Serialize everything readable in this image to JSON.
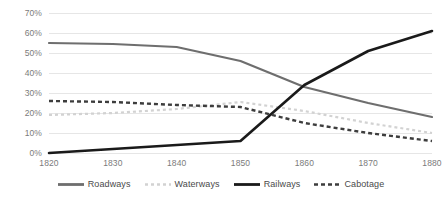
{
  "chart_data": {
    "type": "line",
    "title": "",
    "subtitle": "",
    "xlabel": "",
    "ylabel": "",
    "x": [
      1820,
      1830,
      1840,
      1850,
      1860,
      1870,
      1880
    ],
    "categories": [
      "1820",
      "1830",
      "1840",
      "1850",
      "1860",
      "1870",
      "1880"
    ],
    "xlim": [
      1820,
      1880
    ],
    "ylim": [
      0,
      70
    ],
    "ytick_values": [
      0,
      10,
      20,
      30,
      40,
      50,
      60,
      70
    ],
    "ytick_labels": [
      "0%",
      "10%",
      "20%",
      "30%",
      "40%",
      "50%",
      "60%",
      "70%"
    ],
    "xtick_labels": [
      "1820",
      "1830",
      "1840",
      "1850",
      "1860",
      "1870",
      "1880"
    ],
    "grid": true,
    "grid_axis": "y",
    "grid_color": "#e6e6e6",
    "legend_position": "bottom",
    "series": [
      {
        "name": "Roadways",
        "values": [
          55,
          54.5,
          53,
          46,
          33,
          25,
          18
        ],
        "color": "#6e6e6e",
        "style": "solid",
        "width": 2.2,
        "dasharray": ""
      },
      {
        "name": "Waterways",
        "values": [
          19,
          20,
          22,
          25.5,
          21,
          15,
          10
        ],
        "color": "#d2d2d2",
        "style": "dotted",
        "width": 2.2,
        "dasharray": "3,3"
      },
      {
        "name": "Railways",
        "values": [
          0,
          2,
          4,
          6,
          34,
          51,
          61
        ],
        "color": "#1a1a1a",
        "style": "solid",
        "width": 2.6,
        "dasharray": ""
      },
      {
        "name": "Cabotage",
        "values": [
          26,
          25.5,
          24,
          23,
          15,
          10,
          6
        ],
        "color": "#3d3d3d",
        "style": "dashed",
        "width": 2.4,
        "dasharray": "4,3"
      }
    ]
  },
  "axis": {
    "y_labels": [
      {
        "text": "70%",
        "value": 70
      },
      {
        "text": "60%",
        "value": 60
      },
      {
        "text": "50%",
        "value": 50
      },
      {
        "text": "40%",
        "value": 40
      },
      {
        "text": "30%",
        "value": 30
      },
      {
        "text": "20%",
        "value": 20
      },
      {
        "text": "10%",
        "value": 10
      },
      {
        "text": "0%",
        "value": 0
      }
    ],
    "x_labels": [
      {
        "text": "1820",
        "value": 1820
      },
      {
        "text": "1830",
        "value": 1830
      },
      {
        "text": "1840",
        "value": 1840
      },
      {
        "text": "1850",
        "value": 1850
      },
      {
        "text": "1860",
        "value": 1860
      },
      {
        "text": "1870",
        "value": 1870
      },
      {
        "text": "1880",
        "value": 1880
      }
    ]
  },
  "legend": {
    "items": [
      {
        "label": "Roadways",
        "color": "#6e6e6e",
        "dasharray": ""
      },
      {
        "label": "Waterways",
        "color": "#d2d2d2",
        "dasharray": "3,3"
      },
      {
        "label": "Railways",
        "color": "#1a1a1a",
        "dasharray": ""
      },
      {
        "label": "Cabotage",
        "color": "#3d3d3d",
        "dasharray": "4,3"
      }
    ]
  }
}
